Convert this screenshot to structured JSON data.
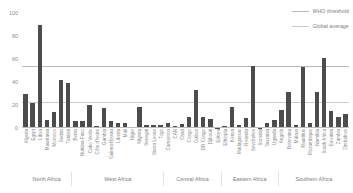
{
  "chart_data": {
    "type": "bar",
    "title": "",
    "xlabel": "",
    "ylabel": "",
    "ylim": [
      0,
      100
    ],
    "yticks": [
      0,
      20,
      40,
      60,
      80,
      100
    ],
    "grid": true,
    "legend_position": "top-right",
    "bar_color": "#4c4c4c",
    "categories": [
      "Algeria",
      "Egypt",
      "Libya",
      "Mauritania",
      "Morocco",
      "Sudan",
      "Tunisia",
      "Benin",
      "Burkina Faso",
      "Cabo Verde",
      "Côte d'Ivoire",
      "Gambia",
      "Guinea-Bissau",
      "Liberia",
      "Mali",
      "Niger",
      "Nigeria",
      "Senegal",
      "Sierra Leone",
      "Togo",
      "Cameroon",
      "CAR",
      "Chad",
      "Congo",
      "Gabon",
      "DR Congo",
      "Djibouti",
      "Eritrea",
      "Ethiopia",
      "Kenya",
      "Madagascar",
      "Rwanda",
      "Seychelles",
      "Somalia",
      "Tanzania",
      "Uganda",
      "Angola",
      "Botswana",
      "Malawi",
      "Mauritius",
      "Mozambique",
      "Namibia",
      "South Africa",
      "Eswatini",
      "Zambia",
      "Zimbabwe"
    ],
    "values": [
      30,
      22,
      90,
      7,
      14,
      42,
      39,
      6.5,
      6.5,
      20,
      2,
      17,
      6.5,
      4,
      4,
      0.6,
      18,
      3,
      3,
      3,
      4,
      1.5,
      3.5,
      10,
      33,
      10,
      8,
      0,
      2,
      18,
      3,
      8.5,
      54,
      0.3,
      4,
      7,
      16,
      31,
      3,
      53,
      4.5,
      31,
      61,
      15,
      9.5,
      12
    ],
    "series": [
      {
        "name": "Density of health workers",
        "values": [
          30,
          22,
          90,
          7,
          14,
          42,
          39,
          6.5,
          6.5,
          20,
          2,
          17,
          6.5,
          4,
          4,
          0.6,
          18,
          3,
          3,
          3,
          4,
          1.5,
          3.5,
          10,
          33,
          10,
          8,
          0,
          2,
          18,
          3,
          8.5,
          54,
          0.3,
          4,
          7,
          16,
          31,
          3,
          53,
          4.5,
          31,
          61,
          15,
          9.5,
          12
        ]
      }
    ],
    "reference_lines": [
      {
        "name": "WHO threshold",
        "value": 53,
        "color": "#b9b9b9"
      },
      {
        "name": "Global average",
        "value": 22,
        "color": "#cccccc"
      }
    ],
    "groups": [
      {
        "label": "North Africa",
        "count": 7
      },
      {
        "label": "West Africa",
        "count": 13
      },
      {
        "label": "Central Africa",
        "count": 8
      },
      {
        "label": "Eastern Africa",
        "count": 8
      },
      {
        "label": "Southern Africa",
        "count": 10
      }
    ]
  },
  "legend": {
    "items": [
      {
        "label": "WHO threshold"
      },
      {
        "label": "Global average"
      }
    ]
  }
}
